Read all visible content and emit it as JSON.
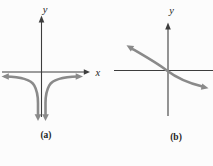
{
  "figure": {
    "type": "math-sketch-pair",
    "background": "#fcfcfc",
    "axis_color": "#3d3d3d",
    "curve_color": "#8a8a8a",
    "label_color": "#1f1f1f",
    "panels": [
      {
        "caption": "(a)",
        "y_axis_label": "y",
        "x_axis_label": "x",
        "curve_description": "Two gray branches hugging the x-axis from below with outward arrows at the left and right ends, both bending down and plunging toward negative infinity on either side of the y-axis, ending in two downward arrows"
      },
      {
        "caption": "(b)",
        "y_axis_label": "y",
        "x_axis_label": "",
        "curve_description": "Decreasing S-shaped gray curve through the origin with an arrow pointing up-left at the top end and an arrow pointing down-right at the bottom end; x-axis runs off the right edge"
      }
    ]
  }
}
